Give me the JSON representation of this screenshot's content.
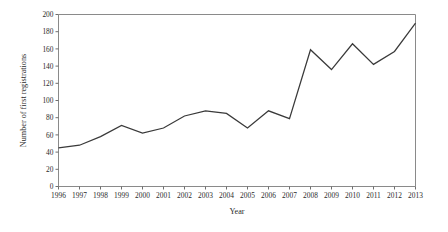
{
  "chart_data": {
    "type": "line",
    "title": "",
    "xlabel": "Year",
    "ylabel": "Number of first registrations",
    "x": [
      1996,
      1997,
      1998,
      1999,
      2000,
      2001,
      2002,
      2003,
      2004,
      2005,
      2006,
      2007,
      2008,
      2009,
      2010,
      2011,
      2012,
      2013
    ],
    "categories": [
      "1996",
      "1997",
      "1998",
      "1999",
      "2000",
      "2001",
      "2002",
      "2003",
      "2004",
      "2005",
      "2006",
      "2007",
      "2008",
      "2009",
      "2010",
      "2011",
      "2012",
      "2013"
    ],
    "values": [
      45,
      48,
      58,
      71,
      62,
      68,
      82,
      88,
      85,
      68,
      88,
      79,
      159,
      136,
      166,
      142,
      157,
      190
    ],
    "series": [
      {
        "name": "Number of first registrations",
        "values": [
          45,
          48,
          58,
          71,
          62,
          68,
          82,
          88,
          85,
          68,
          88,
          79,
          159,
          136,
          166,
          142,
          157,
          190
        ]
      }
    ],
    "ylim": [
      0,
      200
    ],
    "ytick_step": 20,
    "yticks": [
      0,
      20,
      40,
      60,
      80,
      100,
      120,
      140,
      160,
      180,
      200
    ],
    "ytick_labels": [
      "0",
      "20",
      "40",
      "60",
      "80",
      "100",
      "120",
      "140",
      "160",
      "180",
      "200"
    ],
    "xtick_labels": [
      "1996",
      "1997",
      "1998",
      "1999",
      "2000",
      "2001",
      "2002",
      "2003",
      "2004",
      "2005",
      "2006",
      "2007",
      "2008",
      "2009",
      "2010",
      "2011",
      "2012",
      "2013"
    ],
    "grid": false,
    "legend": null,
    "legend_position": "none",
    "line_color": "#3a3a3a",
    "frame_color": "#8a8a8a",
    "background_color": "#ffffff",
    "annotations": []
  }
}
